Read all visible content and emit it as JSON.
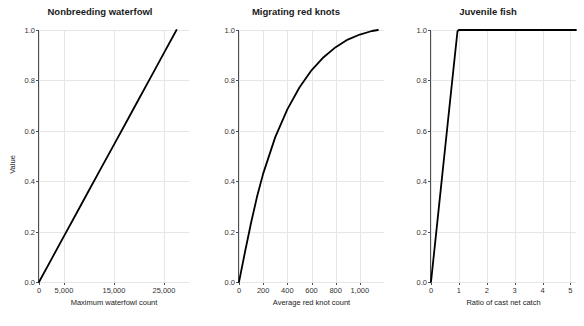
{
  "figure": {
    "ylabel": "Value",
    "y_ticks": [
      "0.0",
      "0.2",
      "0.4",
      "0.6",
      "0.8",
      "1.0"
    ],
    "y_values": [
      0.0,
      0.2,
      0.4,
      0.6,
      0.8,
      1.0
    ]
  },
  "chart_data": [
    {
      "type": "line",
      "title": "Nonbreeding waterfowl",
      "xlabel": "Maximum waterfowl count",
      "ylabel": "Value",
      "xlim": [
        0,
        30000
      ],
      "ylim": [
        0.0,
        1.0
      ],
      "x_ticks": [
        0,
        5000,
        15000,
        25000
      ],
      "x_tick_labels": [
        "0",
        "5,000",
        "15,000",
        "25,000"
      ],
      "y_ticks": [
        0.0,
        0.2,
        0.4,
        0.6,
        0.8,
        1.0
      ],
      "y_tick_labels": [
        "0.0",
        "0.2",
        "0.4",
        "0.6",
        "0.8",
        "1.0"
      ],
      "grid": true,
      "legend": "none",
      "x": [
        0,
        2500,
        5000,
        7500,
        10000,
        12500,
        15000,
        17500,
        20000,
        22500,
        25000,
        27500
      ],
      "y": [
        0.0,
        0.091,
        0.182,
        0.273,
        0.364,
        0.455,
        0.545,
        0.636,
        0.727,
        0.818,
        0.909,
        1.0
      ]
    },
    {
      "type": "line",
      "title": "Migrating red knots",
      "xlabel": "Average red knot count",
      "ylabel": "Value",
      "xlim": [
        0,
        1200
      ],
      "ylim": [
        0.0,
        1.0
      ],
      "x_ticks": [
        0,
        200,
        400,
        600,
        800,
        1000
      ],
      "x_tick_labels": [
        "0",
        "200",
        "400",
        "600",
        "800",
        "1,000"
      ],
      "y_ticks": [
        0.0,
        0.2,
        0.4,
        0.6,
        0.8,
        1.0
      ],
      "y_tick_labels": [
        "0.0",
        "0.2",
        "0.4",
        "0.6",
        "0.8",
        "1.0"
      ],
      "grid": true,
      "legend": "none",
      "x": [
        0,
        50,
        100,
        150,
        200,
        300,
        400,
        500,
        600,
        700,
        800,
        900,
        1000,
        1100,
        1150
      ],
      "y": [
        0.0,
        0.12,
        0.235,
        0.34,
        0.43,
        0.575,
        0.685,
        0.772,
        0.84,
        0.892,
        0.932,
        0.962,
        0.982,
        0.996,
        1.0
      ]
    },
    {
      "type": "line",
      "title": "Juvenile fish",
      "xlabel": "Ratio of cast net catch",
      "ylabel": "Value",
      "xlim": [
        0,
        5.2
      ],
      "ylim": [
        0.0,
        1.0
      ],
      "x_ticks": [
        0,
        1,
        2,
        3,
        4,
        5
      ],
      "x_tick_labels": [
        "0",
        "1",
        "2",
        "3",
        "4",
        "5"
      ],
      "y_ticks": [
        0.0,
        0.2,
        0.4,
        0.6,
        0.8,
        1.0
      ],
      "y_tick_labels": [
        "0.0",
        "0.2",
        "0.4",
        "0.6",
        "0.8",
        "1.0"
      ],
      "grid": true,
      "legend": "none",
      "x": [
        0,
        0.2,
        0.4,
        0.6,
        0.8,
        0.95,
        1.0,
        2.0,
        3.0,
        4.0,
        5.2
      ],
      "y": [
        0.0,
        0.21,
        0.42,
        0.63,
        0.84,
        0.995,
        1.0,
        1.0,
        1.0,
        1.0,
        1.0
      ]
    }
  ]
}
